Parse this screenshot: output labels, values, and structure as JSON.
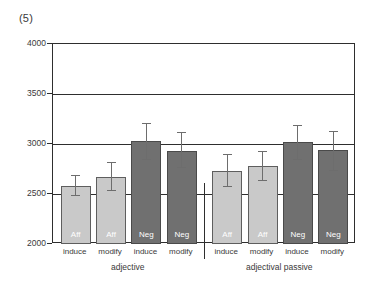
{
  "figure": {
    "number": "(5)"
  },
  "chart_data": {
    "type": "bar",
    "title": "",
    "xlabel": "",
    "ylabel": "",
    "ylim": [
      2000,
      4000
    ],
    "yticks": [
      2000,
      2500,
      3000,
      3500,
      4000
    ],
    "ytick_labels": [
      "2000",
      "2500",
      "3000",
      "3500",
      "4000"
    ],
    "grid": true,
    "legend": "none",
    "groups": [
      {
        "name": "adjective",
        "bars": [
          {
            "condition": "induce",
            "polarity": "Aff",
            "value": 2580,
            "err_low": 2480,
            "err_high": 2690,
            "color": "#c9c9c9"
          },
          {
            "condition": "modify",
            "polarity": "Aff",
            "value": 2670,
            "err_low": 2530,
            "err_high": 2820,
            "color": "#c9c9c9"
          },
          {
            "condition": "induce",
            "polarity": "Neg",
            "value": 3030,
            "err_low": 2840,
            "err_high": 3210,
            "color": "#707070"
          },
          {
            "condition": "modify",
            "polarity": "Neg",
            "value": 2930,
            "err_low": 2760,
            "err_high": 3120,
            "color": "#707070"
          }
        ]
      },
      {
        "name": "adjectival passive",
        "bars": [
          {
            "condition": "induce",
            "polarity": "Aff",
            "value": 2730,
            "err_low": 2570,
            "err_high": 2900,
            "color": "#c9c9c9"
          },
          {
            "condition": "modify",
            "polarity": "Aff",
            "value": 2780,
            "err_low": 2630,
            "err_high": 2930,
            "color": "#c9c9c9"
          },
          {
            "condition": "induce",
            "polarity": "Neg",
            "value": 3020,
            "err_low": 2840,
            "err_high": 3190,
            "color": "#707070"
          },
          {
            "condition": "modify",
            "polarity": "Neg",
            "value": 2940,
            "err_low": 2730,
            "err_high": 3130,
            "color": "#707070"
          }
        ]
      }
    ]
  },
  "colors": {
    "affirmative": "#c9c9c9",
    "negative": "#707070",
    "axis": "#2e2e2e",
    "errorbar": "#6d6d6d",
    "bar_label_text": "#ffffff"
  }
}
